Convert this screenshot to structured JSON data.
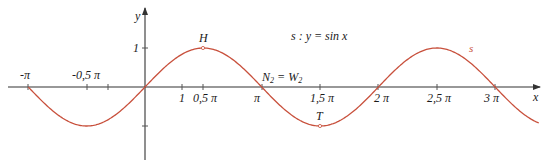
{
  "chart_data": {
    "type": "line",
    "title": "s : y = sin x",
    "xlabel": "x",
    "ylabel": "y",
    "xlim": [
      -3.5,
      12.2
    ],
    "ylim": [
      -2,
      2.2
    ],
    "grid": false,
    "x_ticks": [
      {
        "value": -3.14159,
        "label": "-π"
      },
      {
        "value": -1.5708,
        "label": "-0,5 π"
      },
      {
        "value": -1.0,
        "label": ""
      },
      {
        "value": 1.0,
        "label": "1"
      },
      {
        "value": 1.5708,
        "label": "0,5 π"
      },
      {
        "value": 3.14159,
        "label": "π"
      },
      {
        "value": 4.7124,
        "label": "1,5 π"
      },
      {
        "value": 6.2832,
        "label": "2 π"
      },
      {
        "value": 7.854,
        "label": "2,5 π"
      },
      {
        "value": 9.4248,
        "label": "3 π"
      }
    ],
    "y_ticks": [
      {
        "value": 1,
        "label": "1"
      },
      {
        "value": -1,
        "label": ""
      }
    ],
    "series": [
      {
        "name": "s",
        "function": "sin(x)",
        "color": "#c8503c",
        "x_range": [
          -3.14159,
          10.6
        ]
      }
    ],
    "annotations": [
      {
        "label": "H",
        "x": 1.5708,
        "y": 1,
        "note": "maximum point"
      },
      {
        "label": "T",
        "x": 4.7124,
        "y": -1,
        "note": "minimum point"
      },
      {
        "label": "N₂ = W₂",
        "x": 3.14159,
        "y": 0,
        "note": "zero / inflection point"
      }
    ]
  },
  "labels": {
    "equation": "s : y = sin x",
    "curve_name": "s",
    "x_axis": "x",
    "y_axis": "y",
    "H": "H",
    "T": "T",
    "N2": "N",
    "N2_sub": "2",
    "eq_sign": " = ",
    "W2": "W",
    "W2_sub": "2",
    "tick_neg_pi": "-π",
    "tick_neg_half_pi": "-0,5 π",
    "tick_one": "1",
    "tick_half_pi": "0,5 π",
    "tick_pi": "π",
    "tick_1_5_pi": "1,5 π",
    "tick_2_pi": "2 π",
    "tick_2_5_pi": "2,5 π",
    "tick_3_pi": "3 π",
    "y_tick_one": "1"
  },
  "colors": {
    "curve": "#c8503c",
    "axis": "#333333",
    "text": "#1a1a1a"
  }
}
